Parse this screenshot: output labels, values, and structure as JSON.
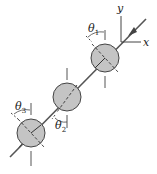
{
  "diagram": {
    "axes": {
      "x_label": "x",
      "y_label": "y"
    },
    "angles": [
      {
        "symbol": "θ",
        "sub": "1"
      },
      {
        "symbol": "θ",
        "sub": "2"
      },
      {
        "symbol": "θ",
        "sub": "3"
      }
    ],
    "colors": {
      "disk_fill": "#c4c4c4",
      "stroke": "#444444",
      "background": "#ffffff"
    }
  }
}
